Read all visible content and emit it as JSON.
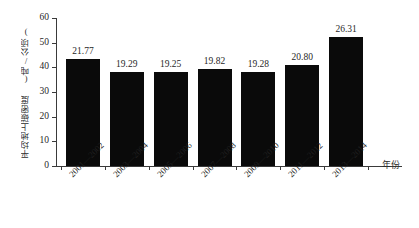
{
  "chart_data": {
    "type": "bar",
    "title": "",
    "subtitle": "",
    "xlabel": "年份",
    "ylabel": "平均地上碳密度 (吨/公顷)",
    "categories": [
      "2001—2002",
      "2003—2004",
      "2005—2006",
      "2007—2008",
      "2009—2010",
      "2011—2012",
      "2013—2014"
    ],
    "values": [
      21.77,
      19.29,
      19.25,
      19.82,
      19.28,
      20.8,
      26.31
    ],
    "value_labels": [
      "21.77",
      "19.29",
      "19.25",
      "19.82",
      "19.28",
      "20.80",
      "26.31"
    ],
    "bar_tops_axis_units": [
      43.5,
      38.0,
      38.0,
      39.2,
      38.0,
      41.0,
      52.2
    ],
    "ylim": [
      0,
      60
    ],
    "ytick_labels": [
      "0",
      "10",
      "20",
      "30",
      "40",
      "50",
      "60"
    ],
    "ytick_values": [
      0,
      10,
      20,
      30,
      40,
      50,
      60
    ],
    "grid": false,
    "legend": null,
    "legend_position": "none",
    "bar_color": "#0a0a0a",
    "axis_color": "#3a3a3a",
    "background_color": "#ffffff",
    "text_color": "#1f1f1f"
  }
}
